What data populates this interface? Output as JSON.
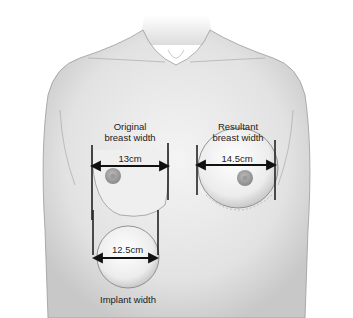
{
  "diagram": {
    "labels": {
      "original_line1": "Original",
      "original_line2": "breast width",
      "resultant_line1": "Resultant",
      "resultant_line2": "breast width",
      "implant": "Implant width"
    },
    "measurements": {
      "original": "13cm",
      "resultant": "14.5cm",
      "implant": "12.5cm"
    }
  }
}
